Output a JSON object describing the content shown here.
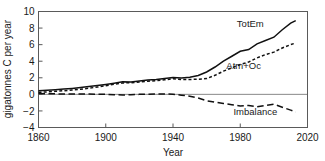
{
  "chart_data": {
    "type": "line",
    "title": "",
    "xlabel": "Year",
    "ylabel": "gigatonnes C per year",
    "xlim": [
      1860,
      2020
    ],
    "ylim": [
      -4,
      10
    ],
    "xticks": [
      1860,
      1900,
      1940,
      1980,
      2020
    ],
    "yticks": [
      -4,
      -2,
      0,
      2,
      4,
      6,
      8,
      10
    ],
    "xtick_labels": [
      "1860",
      "1900",
      "1940",
      "1980",
      "2020"
    ],
    "ytick_labels": [
      "-4",
      "-2",
      "0",
      "2",
      "4",
      "6",
      "8",
      "10"
    ],
    "grid": false,
    "legend_position": "inline-annotations",
    "zero_reference_line": true,
    "series": [
      {
        "name": "TotEm",
        "style": "solid",
        "color": "#111111",
        "label_x": 1986,
        "label_y": 8.1,
        "x": [
          1860,
          1865,
          1870,
          1875,
          1880,
          1885,
          1890,
          1895,
          1900,
          1905,
          1910,
          1915,
          1920,
          1925,
          1930,
          1935,
          1940,
          1945,
          1950,
          1955,
          1960,
          1965,
          1970,
          1975,
          1980,
          1985,
          1990,
          1995,
          2000,
          2005,
          2010,
          2013
        ],
        "values": [
          0.45,
          0.5,
          0.56,
          0.64,
          0.72,
          0.82,
          0.94,
          1.06,
          1.2,
          1.35,
          1.52,
          1.5,
          1.62,
          1.72,
          1.78,
          1.9,
          2.02,
          1.96,
          2.06,
          2.28,
          2.7,
          3.3,
          4.0,
          4.6,
          5.2,
          5.4,
          6.1,
          6.5,
          6.9,
          7.8,
          8.6,
          8.9
        ]
      },
      {
        "name": "Atm+Oc",
        "style": "dotted",
        "color": "#111111",
        "label_x": 1982,
        "label_y": 3.1,
        "x": [
          1860,
          1865,
          1870,
          1875,
          1880,
          1885,
          1890,
          1895,
          1900,
          1905,
          1910,
          1915,
          1920,
          1925,
          1930,
          1935,
          1940,
          1945,
          1950,
          1955,
          1960,
          1965,
          1970,
          1975,
          1980,
          1985,
          1990,
          1995,
          2000,
          2005,
          2010,
          2013
        ],
        "values": [
          0.25,
          0.3,
          0.36,
          0.44,
          0.52,
          0.62,
          0.74,
          0.88,
          1.04,
          1.22,
          1.38,
          1.4,
          1.5,
          1.58,
          1.66,
          1.76,
          1.88,
          1.8,
          1.8,
          1.82,
          1.9,
          2.3,
          2.8,
          3.2,
          3.6,
          3.9,
          4.4,
          4.8,
          5.1,
          5.6,
          6.0,
          6.2
        ]
      },
      {
        "name": "Imbalance",
        "style": "dashed",
        "color": "#111111",
        "label_x": 1989,
        "label_y": -2.45,
        "x": [
          1860,
          1865,
          1870,
          1875,
          1880,
          1885,
          1890,
          1895,
          1900,
          1905,
          1910,
          1915,
          1920,
          1925,
          1930,
          1935,
          1940,
          1945,
          1950,
          1955,
          1960,
          1965,
          1970,
          1975,
          1980,
          1985,
          1990,
          1995,
          2000,
          2005,
          2010,
          2013
        ],
        "values": [
          0.1,
          0.08,
          0.06,
          0.05,
          0.04,
          0.04,
          0.03,
          0.02,
          0.0,
          -0.04,
          -0.08,
          -0.04,
          0.0,
          0.02,
          0.04,
          0.05,
          0.02,
          -0.1,
          -0.22,
          -0.45,
          -0.78,
          -0.95,
          -1.1,
          -1.25,
          -1.4,
          -1.35,
          -1.5,
          -1.35,
          -1.2,
          -1.55,
          -1.9,
          -2.15
        ]
      }
    ]
  },
  "axis": {
    "xlabel": "Year",
    "ylabel": "gigatonnes C per year"
  }
}
